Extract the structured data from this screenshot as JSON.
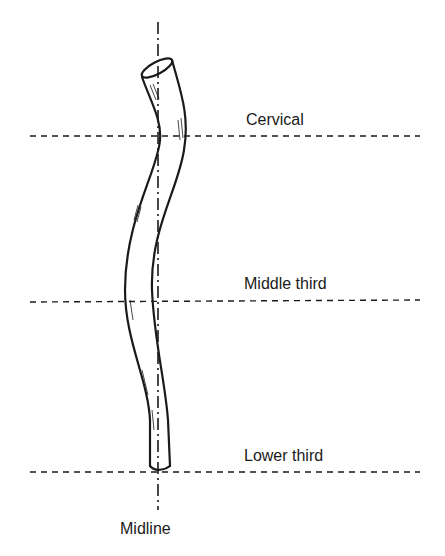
{
  "diagram": {
    "labels": {
      "cervical": "Cervical",
      "middle": "Middle third",
      "lower": "Lower third",
      "midline": "Midline"
    },
    "colors": {
      "ink": "#1a1a1a",
      "background": "#ffffff"
    }
  }
}
